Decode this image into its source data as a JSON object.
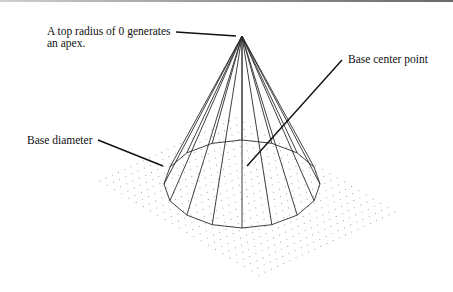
{
  "diagram": {
    "labels": {
      "apex_line1": "A top radius of 0 generates",
      "apex_line2": "an apex.",
      "base_center": "Base center point",
      "base_diameter": "Base diameter"
    },
    "colors": {
      "lines": "#222222",
      "grid_dots": "#a0a0a0",
      "background": "#ffffff"
    }
  }
}
